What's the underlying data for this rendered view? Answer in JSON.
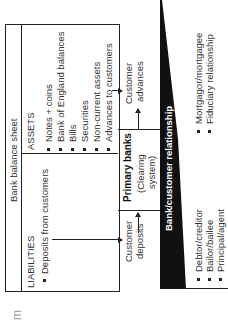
{
  "figure": {
    "rotation": "90deg counter-clockwise",
    "corner_mark": "m"
  },
  "balance_sheet": {
    "title": "Bank balance sheet",
    "liabilities": {
      "header": "LIABILITIES",
      "items": [
        "Deposits from customers"
      ]
    },
    "assets": {
      "header": "ASSETS",
      "items": [
        "Notes + coins",
        "Bank of England balances",
        "Bills",
        "Securities",
        "Non-current assets",
        "Advances to customers"
      ]
    }
  },
  "flow": {
    "customer_deposits": [
      "Customer",
      "deposits"
    ],
    "primary_banks": "Primary banks",
    "clearing_system": [
      "(Clearing",
      "system)"
    ],
    "customer_advances": [
      "Customer",
      "advances"
    ]
  },
  "relationship": {
    "title": "Bank/customer relationship",
    "left_items": [
      "Debtor/creditor",
      "Bailor/bailee",
      "Principal/agent"
    ],
    "right_items": [
      "Mortgagor/mortgagee",
      "Fiduciary relationship"
    ]
  }
}
